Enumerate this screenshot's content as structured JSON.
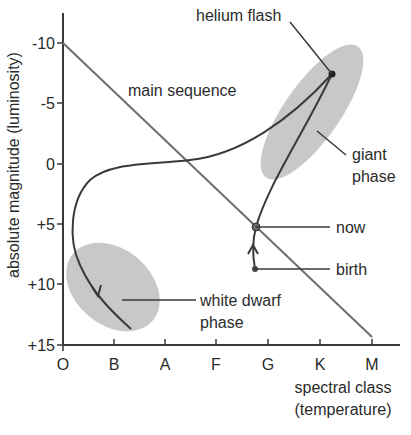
{
  "diagram": {
    "title": "",
    "y_axis": {
      "label": "absolute magnitude (luminosity)",
      "ticks": [
        "-10",
        "-5",
        "0",
        "+5",
        "+10",
        "+15"
      ]
    },
    "x_axis": {
      "label_line1": "spectral class",
      "label_line2": "(temperature)",
      "ticks": [
        "O",
        "B",
        "A",
        "F",
        "G",
        "K",
        "M"
      ]
    },
    "annotations": {
      "main_sequence": "main sequence",
      "helium_flash": "helium flash",
      "giant_line1": "giant",
      "giant_line2": "phase",
      "now": "now",
      "birth": "birth",
      "white_dwarf_line1": "white dwarf",
      "white_dwarf_line2": "phase"
    },
    "colors": {
      "line": "#3a3a3a",
      "main_sequence_line": "#6e6e6e",
      "region_fill": "#c8c8c8",
      "text": "#2b2b2b"
    }
  }
}
